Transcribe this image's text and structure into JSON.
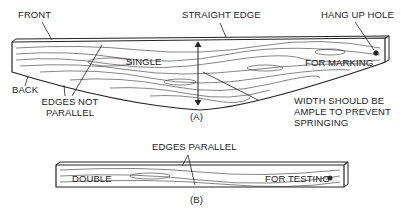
{
  "diagram": {
    "figure_a": {
      "caption": "(A)",
      "labels": {
        "front": "FRONT",
        "straight_edge": "STRAIGHT EDGE",
        "hang_up_hole": "HANG UP HOLE",
        "single": "SINGLE",
        "for_marking": "FOR MARKING",
        "back": "BACK",
        "edges_not_parallel_1": "EDGES NOT",
        "edges_not_parallel_2": "PARALLEL",
        "width_1": "WIDTH SHOULD BE",
        "width_2": "AMPLE TO PREVENT",
        "width_3": "SPRINGING"
      }
    },
    "figure_b": {
      "caption": "(B)",
      "labels": {
        "edges_parallel": "EDGES PARALLEL",
        "double": "DOUBLE",
        "for_testing": "FOR TESTING"
      }
    },
    "colors": {
      "ink": "#222222",
      "background": "#ffffff"
    }
  }
}
